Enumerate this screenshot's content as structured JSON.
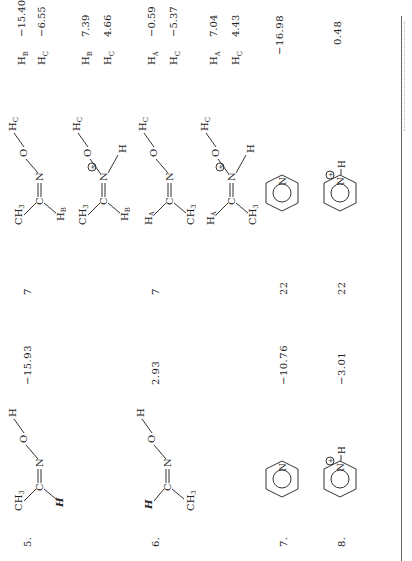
{
  "table": {
    "rows": [
      {
        "number": "5.",
        "neutral_structure": {
          "label": "acetaldoxime (H, syn)",
          "atoms": [
            "CH3",
            "C",
            "N",
            "O",
            "H",
            "H"
          ]
        },
        "neutral_value": "−15.93",
        "ref": "7",
        "protonated_structure": {
          "atoms": [
            "CH3",
            "C",
            "N",
            "O",
            "HC",
            "HB",
            "H",
            "⊕"
          ]
        },
        "shifts": [
          {
            "label": "H_B",
            "value": "−15.40"
          },
          {
            "label": "H_C",
            "value": "−6.55"
          }
        ]
      },
      {
        "number": "6.",
        "neutral_structure": {
          "label": "acetaldoxime (H, anti)",
          "atoms": [
            "H",
            "C",
            "CH3",
            "N",
            "O",
            "H"
          ]
        },
        "neutral_value": "2.93",
        "ref": "7",
        "protonated_structure": {
          "atoms": [
            "HA",
            "C",
            "CH3",
            "N",
            "O",
            "HC",
            "H",
            "⊕"
          ]
        },
        "shifts": [
          {
            "label": "H_B",
            "value": "7.39"
          },
          {
            "label": "H_C",
            "value": "4.66"
          }
        ]
      },
      {
        "number": "7.",
        "neutral_structure": {
          "label": "pyridine",
          "atoms": [
            "N"
          ]
        },
        "neutral_value": "−10.76",
        "ref": "22",
        "protonated_structure": {
          "atoms": [
            "N"
          ]
        },
        "shifts": [
          {
            "label": "H_A",
            "value": "−0.59"
          },
          {
            "label": "H_C",
            "value": "−5.37"
          }
        ]
      },
      {
        "number": "8.",
        "neutral_structure": {
          "label": "pyridinium",
          "atoms": [
            "N",
            "H",
            "⊕"
          ]
        },
        "neutral_value": "−3.01",
        "ref": "22",
        "protonated_structure": {
          "atoms": [
            "N",
            "H",
            "⊕"
          ]
        },
        "shifts": [
          {
            "label": "H_A",
            "value": "7.04"
          },
          {
            "label": "H_C",
            "value": "4.43"
          }
        ]
      }
    ],
    "right_column": [
      {
        "value": "−16.98"
      },
      {
        "value": "0.48"
      }
    ]
  },
  "labels": {
    "CH3": "CH",
    "three": "3",
    "H": "H",
    "C": "C",
    "N": "N",
    "O": "O",
    "HB": "H",
    "HC": "H",
    "HA": "H",
    "sB": "B",
    "sC": "C",
    "sA": "A",
    "plus": "⊕"
  }
}
